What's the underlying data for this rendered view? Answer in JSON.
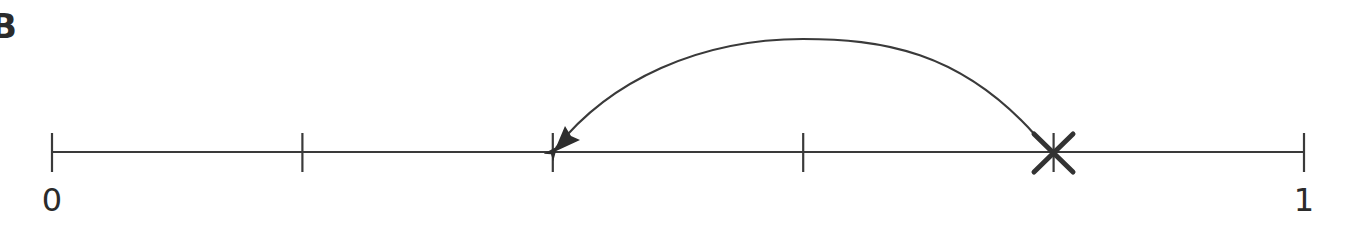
{
  "panel": {
    "label": "B"
  },
  "number_line": {
    "start_label": "0",
    "end_label": "1",
    "divisions": 5,
    "tick_positions": [
      0,
      0.2,
      0.4,
      0.6,
      0.8,
      1
    ],
    "marker": {
      "type": "cross",
      "value": 0.8
    },
    "jump_arrow": {
      "from": 0.8,
      "to": 0.4,
      "direction": "left"
    },
    "colors": {
      "line": "#3a3a3a",
      "text": "#2b2b2b"
    }
  }
}
